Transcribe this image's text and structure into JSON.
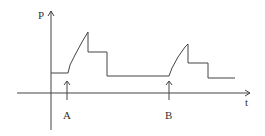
{
  "diagram": {
    "y_axis_label": "P",
    "x_axis_label": "t",
    "markers": [
      {
        "label": "A",
        "x": 67
      },
      {
        "label": "B",
        "x": 169
      }
    ],
    "line_color": "#444444",
    "curve_points": "51,73 68,73 70,65 75,55 82,42 88,32 88,52 107,52 107,76 165,76 169,76 172,68 178,57 185,47 188,44 188,63 208,63 208,78 235,78"
  }
}
